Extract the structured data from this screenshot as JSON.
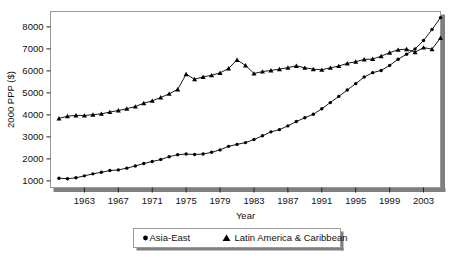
{
  "chart_data": {
    "type": "line",
    "title": "",
    "subtitle": "",
    "xlabel": "Year",
    "ylabel": "2000 PPP ($)",
    "xlim": [
      1959,
      2005
    ],
    "ylim": [
      700,
      8700
    ],
    "yticks": [
      1000,
      2000,
      3000,
      4000,
      5000,
      6000,
      7000,
      8000
    ],
    "ytick_labels": [
      "1000",
      "2000",
      "3000",
      "4000",
      "5000",
      "6000",
      "7000",
      "8000"
    ],
    "xticks": [
      1963,
      1967,
      1971,
      1975,
      1979,
      1983,
      1987,
      1991,
      1995,
      1999,
      2003
    ],
    "xtick_labels": [
      "1963",
      "1967",
      "1971",
      "1975",
      "1979",
      "1983",
      "1987",
      "1991",
      "1995",
      "1999",
      "2003"
    ],
    "minor_ticks": true,
    "grid": false,
    "legend_position": "below",
    "x": [
      1960,
      1961,
      1962,
      1963,
      1964,
      1965,
      1966,
      1967,
      1968,
      1969,
      1970,
      1971,
      1972,
      1973,
      1974,
      1975,
      1976,
      1977,
      1978,
      1979,
      1980,
      1981,
      1982,
      1983,
      1984,
      1985,
      1986,
      1987,
      1988,
      1989,
      1990,
      1991,
      1992,
      1993,
      1994,
      1995,
      1996,
      1997,
      1998,
      1999,
      2000,
      2001,
      2002,
      2003,
      2004,
      2005
    ],
    "series": [
      {
        "name": "Asia-East",
        "marker": "circle",
        "color": "#000000",
        "values": [
          1120,
          1100,
          1140,
          1230,
          1320,
          1390,
          1470,
          1500,
          1580,
          1680,
          1790,
          1880,
          1970,
          2100,
          2190,
          2220,
          2200,
          2220,
          2300,
          2410,
          2570,
          2660,
          2740,
          2880,
          3050,
          3230,
          3330,
          3500,
          3700,
          3870,
          4030,
          4280,
          4560,
          4840,
          5130,
          5420,
          5720,
          5920,
          6020,
          6250,
          6530,
          6760,
          7000,
          7380,
          7880,
          8420
        ]
      },
      {
        "name": "Latin America & Caribbean",
        "marker": "triangle",
        "color": "#000000",
        "values": [
          3840,
          3940,
          3980,
          3970,
          4010,
          4050,
          4130,
          4200,
          4280,
          4380,
          4530,
          4640,
          4790,
          4960,
          5160,
          5850,
          5620,
          5730,
          5800,
          5910,
          6110,
          6500,
          6250,
          5880,
          5970,
          6020,
          6080,
          6150,
          6230,
          6140,
          6080,
          6050,
          6140,
          6220,
          6340,
          6420,
          6520,
          6540,
          6670,
          6830,
          6960,
          6990,
          6850,
          7060,
          6990,
          7500
        ]
      }
    ]
  },
  "legend": {
    "entries": [
      {
        "marker": "circle",
        "label": "Asia-East"
      },
      {
        "marker": "triangle",
        "label": "Latin America & Caribbean"
      }
    ]
  },
  "colors": {
    "plot_border": "#9a9a9a",
    "shadow": "#808080",
    "line": "#1a1a1a",
    "background": "#ffffff",
    "legend_border": "#9a9a9a"
  }
}
